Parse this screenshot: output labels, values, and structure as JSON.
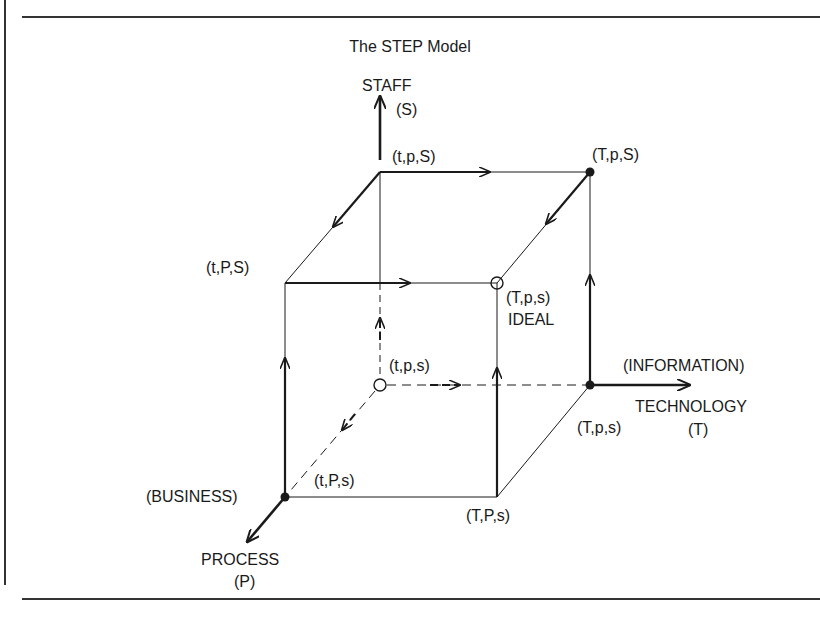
{
  "title": "The STEP Model",
  "axes": {
    "staff": {
      "name": "STAFF",
      "symbol": "(S)"
    },
    "technology": {
      "qualifier": "(INFORMATION)",
      "name": "TECHNOLOGY",
      "symbol": "(T)"
    },
    "process": {
      "qualifier": "(BUSINESS)",
      "name": "PROCESS",
      "symbol": "(P)"
    }
  },
  "vertices": {
    "tpS": "(t,p,S)",
    "TpS": "(T,p,S)",
    "tPS": "(t,P,S)",
    "Tps_front": "(T,p,s)",
    "ideal": "IDEAL",
    "tps": "(t,p,s)",
    "Tps_right": "(T,p,s)",
    "tPs": "(t,P,s)",
    "TPs": "(T,P,s)"
  },
  "colors": {
    "ink": "#1a1a1a",
    "rule": "#333333",
    "background": "#ffffff"
  }
}
